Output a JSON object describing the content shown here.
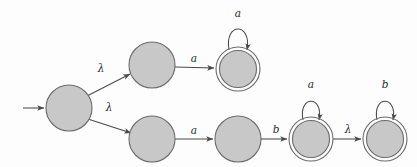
{
  "figure": {
    "kind": "finite-automaton-state-diagram",
    "title": "",
    "background_color": "#fdfdfd",
    "state_fill_color": "#c8c8c8",
    "state_stroke_color": "#6b6b6b",
    "edge_color": "#4a4a4a",
    "label_color": "#2a2a2a"
  },
  "states": [
    {
      "id": "q0",
      "label": "",
      "cx": 69,
      "cy": 108,
      "r": 23,
      "accepting": false,
      "start": true,
      "name": "start-state"
    },
    {
      "id": "q1",
      "label": "",
      "cx": 152,
      "cy": 65,
      "r": 23,
      "accepting": false,
      "start": false,
      "name": "upper-state-1"
    },
    {
      "id": "q2",
      "label": "",
      "cx": 238,
      "cy": 69,
      "r": 22,
      "accepting": true,
      "start": false,
      "name": "upper-accept-state"
    },
    {
      "id": "q3",
      "label": "",
      "cx": 152,
      "cy": 139,
      "r": 23,
      "accepting": false,
      "start": false,
      "name": "lower-state-1"
    },
    {
      "id": "q4",
      "label": "",
      "cx": 238,
      "cy": 139,
      "r": 23,
      "accepting": false,
      "start": false,
      "name": "lower-state-2"
    },
    {
      "id": "q5",
      "label": "",
      "cx": 311,
      "cy": 139,
      "r": 22,
      "accepting": true,
      "start": false,
      "name": "lower-accept-state-1"
    },
    {
      "id": "q6",
      "label": "",
      "cx": 385,
      "cy": 139,
      "r": 22,
      "accepting": true,
      "start": false,
      "name": "lower-accept-state-2"
    }
  ],
  "transitions": [
    {
      "id": "t-start",
      "from": "",
      "to": "q0",
      "symbol": "",
      "kind": "initial-arrow",
      "name": "start-arrow"
    },
    {
      "id": "t0",
      "from": "q0",
      "to": "q1",
      "symbol": "λ",
      "kind": "edge",
      "label_x": 101,
      "label_y": 72,
      "name": "edge-q0-q1-lambda"
    },
    {
      "id": "t1",
      "from": "q0",
      "to": "q3",
      "symbol": "λ",
      "kind": "edge",
      "label_x": 109,
      "label_y": 111,
      "name": "edge-q0-q3-lambda"
    },
    {
      "id": "t2",
      "from": "q1",
      "to": "q2",
      "symbol": "a",
      "kind": "edge",
      "label_x": 194,
      "label_y": 62,
      "name": "edge-q1-q2-a"
    },
    {
      "id": "t3",
      "from": "q2",
      "to": "q2",
      "symbol": "a",
      "kind": "self-loop",
      "label_x": 238,
      "label_y": 14,
      "name": "self-loop-q2-a"
    },
    {
      "id": "t4",
      "from": "q3",
      "to": "q4",
      "symbol": "a",
      "kind": "edge",
      "label_x": 194,
      "label_y": 134,
      "name": "edge-q3-q4-a"
    },
    {
      "id": "t5",
      "from": "q4",
      "to": "q5",
      "symbol": "b",
      "kind": "edge",
      "label_x": 276,
      "label_y": 133,
      "name": "edge-q4-q5-b"
    },
    {
      "id": "t6",
      "from": "q5",
      "to": "q5",
      "symbol": "a",
      "kind": "self-loop",
      "label_x": 311,
      "label_y": 84,
      "name": "self-loop-q5-a"
    },
    {
      "id": "t7",
      "from": "q5",
      "to": "q6",
      "symbol": "λ",
      "kind": "edge",
      "label_x": 348,
      "label_y": 133,
      "name": "edge-q5-q6-lambda"
    },
    {
      "id": "t8",
      "from": "q6",
      "to": "q6",
      "symbol": "b",
      "kind": "self-loop",
      "label_x": 385,
      "label_y": 84,
      "name": "self-loop-q6-b"
    }
  ],
  "alphabet": [
    "a",
    "b",
    "λ"
  ]
}
